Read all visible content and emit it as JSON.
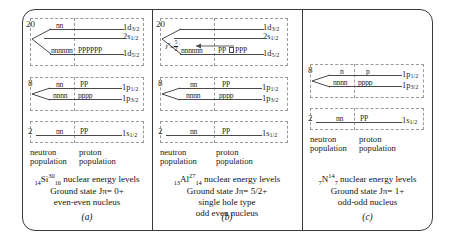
{
  "figure": {
    "panels": [
      {
        "id": "a",
        "letter": "(a)",
        "isotope": {
          "z": "14",
          "symbol": "Si",
          "a": "30",
          "n": "16"
        },
        "caption_lines": [
          "nuclear energy levels",
          "Ground state Jπ= 0+",
          "even-even nucleus"
        ],
        "ground_state": "Jπ = 0+",
        "type_text": "even-even nucleus",
        "neutron_label": "neutron population",
        "proton_label": "proton population",
        "shells": [
          {
            "magic": "20",
            "levels": [
              {
                "orbital": "1d",
                "j": "3/2",
                "neutrons": "nn",
                "protons": "",
                "hole": false
              },
              {
                "orbital": "2s",
                "j": "1/2",
                "neutrons": "",
                "protons": "",
                "hole": false
              },
              {
                "orbital": "1d",
                "j": "5/2",
                "neutrons": "nnnnnn",
                "protons": "PPPPPP",
                "hole": false
              }
            ]
          },
          {
            "magic": "8",
            "levels": [
              {
                "orbital": "1p",
                "j": "1/2",
                "neutrons": "nn",
                "protons": "PP",
                "hole": false
              },
              {
                "orbital": "1p",
                "j": "3/2",
                "neutrons": "nnnn",
                "protons": "pppp",
                "hole": false
              }
            ]
          },
          {
            "magic": "2",
            "levels": [
              {
                "orbital": "1s",
                "j": "1/2",
                "neutrons": "nn",
                "protons": "PP",
                "hole": false
              }
            ]
          }
        ]
      },
      {
        "id": "b",
        "letter": "(b)",
        "isotope": {
          "z": "13",
          "symbol": "Al",
          "a": "27",
          "n": "14"
        },
        "caption_lines": [
          "nuclear energy levels",
          "Ground state Jπ= 5/2+",
          "single hole type",
          "odd even nucleus"
        ],
        "ground_state": "Jπ = 5/2+",
        "type_text": "single hole type",
        "type_text2": "odd even nucleus",
        "annotation": {
          "label": "Jπ =",
          "num": "5",
          "den": "2",
          "sup": "+"
        },
        "neutron_label": "neutron population",
        "proton_label": "proton population",
        "shells": [
          {
            "magic": "20",
            "levels": [
              {
                "orbital": "1d",
                "j": "3/2",
                "neutrons": "",
                "protons": "",
                "hole": false
              },
              {
                "orbital": "2s",
                "j": "1/2",
                "neutrons": "",
                "protons": "",
                "hole": false
              },
              {
                "orbital": "1d",
                "j": "5/2",
                "neutrons": "nnnnnn",
                "protons_pre": "PP",
                "protons_post": "PPP",
                "hole": true
              }
            ]
          },
          {
            "magic": "8",
            "levels": [
              {
                "orbital": "1p",
                "j": "1/2",
                "neutrons": "nn",
                "protons": "PP",
                "hole": false
              },
              {
                "orbital": "1p",
                "j": "3/2",
                "neutrons": "nnnn",
                "protons": "pppp",
                "hole": false
              }
            ]
          },
          {
            "magic": "2",
            "levels": [
              {
                "orbital": "1s",
                "j": "1/2",
                "neutrons": "nn",
                "protons": "PP",
                "hole": false
              }
            ]
          }
        ]
      },
      {
        "id": "c",
        "letter": "(c)",
        "isotope": {
          "z": "7",
          "symbol": "N",
          "a": "14",
          "n": "7"
        },
        "caption_lines": [
          "nuclear energy levels",
          "Ground state Jπ= 1+",
          "odd-odd nucleus"
        ],
        "ground_state": "Jπ = 1+",
        "type_text": "odd-odd nucleus",
        "neutron_label": "neutron population",
        "proton_label": "proton population",
        "shells": [
          {
            "magic": "8",
            "levels": [
              {
                "orbital": "1p",
                "j": "1/2",
                "neutrons": "n",
                "protons": "p",
                "hole": false
              },
              {
                "orbital": "1p",
                "j": "3/2",
                "neutrons": "nnnn",
                "protons": "pppp",
                "hole": false
              }
            ]
          },
          {
            "magic": "2",
            "levels": [
              {
                "orbital": "1s",
                "j": "1/2",
                "neutrons": "nn",
                "protons": "PP",
                "hole": false
              }
            ]
          }
        ]
      }
    ],
    "common": {
      "ground_state_prefix": "Ground state",
      "energy_levels_text": "nuclear energy levels"
    }
  }
}
